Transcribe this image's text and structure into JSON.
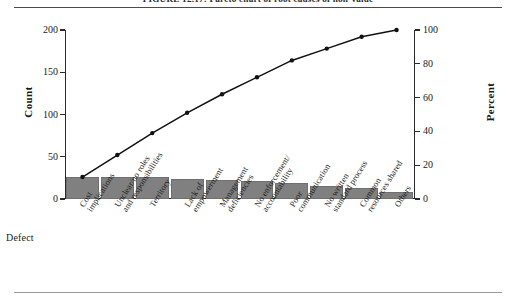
{
  "figure": {
    "caption": "FIGURE 12.17:  Pareto chart of root causes of non-value"
  },
  "axes": {
    "left_title": "Count",
    "right_title": "Percent",
    "category_axis_title": "Defect",
    "left_ticks": [
      "0",
      "50",
      "100",
      "150",
      "200"
    ],
    "right_ticks": [
      "0",
      "20",
      "40",
      "60",
      "80",
      "100"
    ]
  },
  "chart_data": {
    "type": "bar",
    "title": "FIGURE 12.17:  Pareto chart of root causes of non-value",
    "xlabel": "Defect",
    "ylabel": "Count",
    "y2label": "Percent",
    "ylim": [
      0,
      200
    ],
    "y2lim": [
      0,
      100
    ],
    "grid": false,
    "legend": "none",
    "categories": [
      "Cost\nimplications",
      "Unclear/no roles\nand responsibilities",
      "Territory",
      "Lack of\nempowerment",
      "Management\ndeficiencies",
      "No enforcement/\naccountability",
      "Poor\ncommunication",
      "No written\nstandard process",
      "Common\nresources shared",
      "Others"
    ],
    "series": [
      {
        "name": "Count",
        "type": "bar",
        "values": [
          26,
          26,
          26,
          24,
          22,
          21,
          19,
          15,
          13,
          8
        ]
      },
      {
        "name": "Cumulative Percent",
        "type": "line",
        "values": [
          13,
          26,
          39,
          51,
          62,
          72,
          82,
          89,
          96,
          100
        ]
      }
    ]
  },
  "colors": {
    "bar_fill": "#808080",
    "bar_edge": "#6f6f6f",
    "line": "#111111",
    "axis": "#2a2a2a",
    "rule": "#4a4a4a"
  }
}
